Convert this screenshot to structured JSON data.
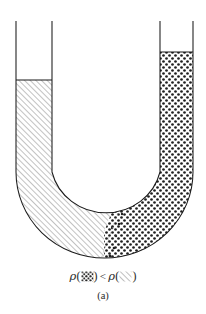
{
  "figure": {
    "name": "u-tube-manometer-diagram",
    "subfigure_label": "(a)",
    "stroke_color": "#1b1b1b",
    "background_color": "#ffffff",
    "geometry": {
      "canvas_width": 206,
      "canvas_height": 314,
      "left_tube_outer_x": 16,
      "left_tube_inner_x": 52,
      "right_tube_inner_x": 160,
      "right_tube_outer_x": 193,
      "tube_top_y": 21,
      "left_liquid_level_y": 80,
      "right_liquid_level_y": 52,
      "outer_bend_bottom_y": 258,
      "inner_bend_bottom_y": 222,
      "straight_section_end_y": 172
    }
  },
  "left_arm": {
    "name": "left-arm-dense-fluid",
    "fill_pattern": "diagonal-hatch",
    "hatch_angle_degrees": 45,
    "hatch_spacing_px": 4,
    "hatch_color": "#6f6f6f",
    "liquid_level_y": 80,
    "relative_density": "greater"
  },
  "right_arm": {
    "name": "right-arm-light-fluid",
    "fill_pattern": "stipple-dots",
    "dot_spacing_px": 6,
    "dot_radius_px": 1.35,
    "dot_color": "#1f1f1f",
    "liquid_level_y": 52,
    "relative_density": "lesser"
  },
  "interface": {
    "name": "fluid-interface-mixing-zone",
    "location": "lower-right-of-bend",
    "description": "diagonal transition with scattered dots"
  },
  "caption": {
    "rho_symbol": "ρ",
    "open_paren": "(",
    "close_paren": ")",
    "less_than": "<",
    "left_term_pattern": "stipple-dots",
    "right_term_pattern": "diagonal-hatch",
    "plain_text": "ρ (dotted) < ρ (hatched)"
  }
}
